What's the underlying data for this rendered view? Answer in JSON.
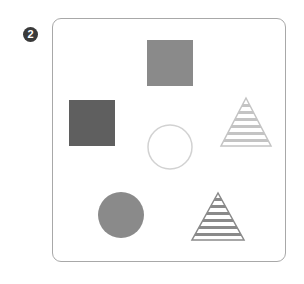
{
  "figure": {
    "badge_label": "2",
    "shapes": [
      {
        "name": "square-top",
        "type": "square",
        "fill": "solid",
        "color": "#8a8a8a",
        "x": 147,
        "y": 40,
        "size": 46
      },
      {
        "name": "square-left",
        "type": "square",
        "fill": "solid",
        "color": "#5f5f5f",
        "x": 69,
        "y": 100,
        "size": 46
      },
      {
        "name": "triangle-right",
        "type": "triangle",
        "fill": "striped",
        "color": "#c4c4c4"
      },
      {
        "name": "circle-center",
        "type": "circle",
        "fill": "outline",
        "color": "#d2d2d2"
      },
      {
        "name": "circle-bottom",
        "type": "circle",
        "fill": "solid",
        "color": "#8a8a8a"
      },
      {
        "name": "triangle-bottom",
        "type": "triangle",
        "fill": "striped",
        "color": "#8a8a8a"
      }
    ]
  }
}
